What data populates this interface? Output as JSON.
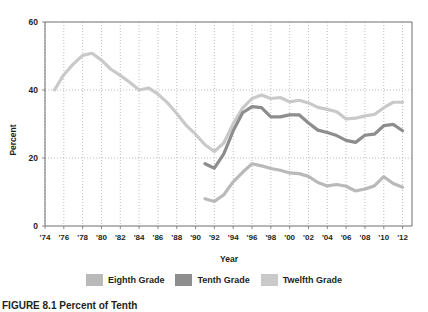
{
  "figure": {
    "caption": "FIGURE 8.1  Percent of Tenth"
  },
  "legend": {
    "position": "bottom-center",
    "items": [
      {
        "label": "Eighth Grade",
        "color": "#b9b9b9"
      },
      {
        "label": "Tenth Grade",
        "color": "#8d8d8d"
      },
      {
        "label": "Twelfth Grade",
        "color": "#c9c9c9"
      }
    ]
  },
  "chart_data": {
    "type": "line",
    "title": "",
    "xlabel": "Year",
    "ylabel": "Percent",
    "ylim": [
      0,
      60
    ],
    "yticks": [
      0,
      20,
      40,
      60
    ],
    "ytick_labels": [
      "0",
      "20",
      "40",
      "60"
    ],
    "xlim": [
      1974,
      2013
    ],
    "xticks": [
      1974,
      1976,
      1978,
      1980,
      1982,
      1984,
      1986,
      1988,
      1990,
      1992,
      1994,
      1996,
      1998,
      2000,
      2002,
      2004,
      2006,
      2008,
      2010,
      2012
    ],
    "xtick_labels": [
      "'74",
      "'76",
      "'78",
      "'80",
      "'82",
      "'84",
      "'86",
      "'88",
      "'90",
      "'92",
      "'94",
      "'96",
      "'98",
      "'00",
      "'02",
      "'04",
      "'06",
      "'08",
      "'10",
      "'12"
    ],
    "grid": true,
    "grid_style": "dotted",
    "series": [
      {
        "name": "Twelfth Grade",
        "color": "#c9c9c9",
        "x": [
          1975,
          1976,
          1977,
          1978,
          1979,
          1980,
          1981,
          1982,
          1983,
          1984,
          1985,
          1986,
          1987,
          1988,
          1989,
          1990,
          1991,
          1992,
          1993,
          1994,
          1995,
          1996,
          1997,
          1998,
          1999,
          2000,
          2001,
          2002,
          2003,
          2004,
          2005,
          2006,
          2007,
          2008,
          2009,
          2010,
          2011,
          2012
        ],
        "values": [
          40.0,
          44.5,
          47.6,
          50.2,
          50.8,
          48.8,
          46.1,
          44.3,
          42.3,
          40.0,
          40.6,
          38.8,
          36.3,
          33.1,
          29.6,
          27.0,
          23.9,
          21.9,
          24.4,
          30.1,
          34.7,
          37.5,
          38.5,
          37.5,
          37.8,
          36.5,
          37.0,
          36.2,
          34.9,
          34.3,
          33.6,
          31.5,
          31.7,
          32.4,
          32.8,
          34.8,
          36.4,
          36.4
        ]
      },
      {
        "name": "Tenth Grade",
        "color": "#8d8d8d",
        "x": [
          1991,
          1992,
          1993,
          1994,
          1995,
          1996,
          1997,
          1998,
          1999,
          2000,
          2001,
          2002,
          2003,
          2004,
          2005,
          2006,
          2007,
          2008,
          2009,
          2010,
          2011,
          2012
        ],
        "values": [
          18.3,
          17.0,
          21.2,
          28.0,
          33.3,
          35.1,
          34.8,
          32.1,
          32.1,
          32.7,
          32.7,
          30.3,
          28.2,
          27.5,
          26.6,
          25.2,
          24.6,
          26.7,
          27.0,
          29.5,
          29.9,
          28.0
        ]
      },
      {
        "name": "Eighth Grade",
        "color": "#b9b9b9",
        "x": [
          1991,
          1992,
          1993,
          1994,
          1995,
          1996,
          1997,
          1998,
          1999,
          2000,
          2001,
          2002,
          2003,
          2004,
          2005,
          2006,
          2007,
          2008,
          2009,
          2010,
          2011,
          2012
        ],
        "values": [
          8.0,
          7.2,
          9.2,
          13.0,
          15.8,
          18.3,
          17.7,
          16.9,
          16.4,
          15.6,
          15.4,
          14.6,
          12.8,
          11.8,
          12.2,
          11.7,
          10.3,
          10.9,
          11.8,
          14.5,
          12.5,
          11.4
        ]
      }
    ]
  }
}
